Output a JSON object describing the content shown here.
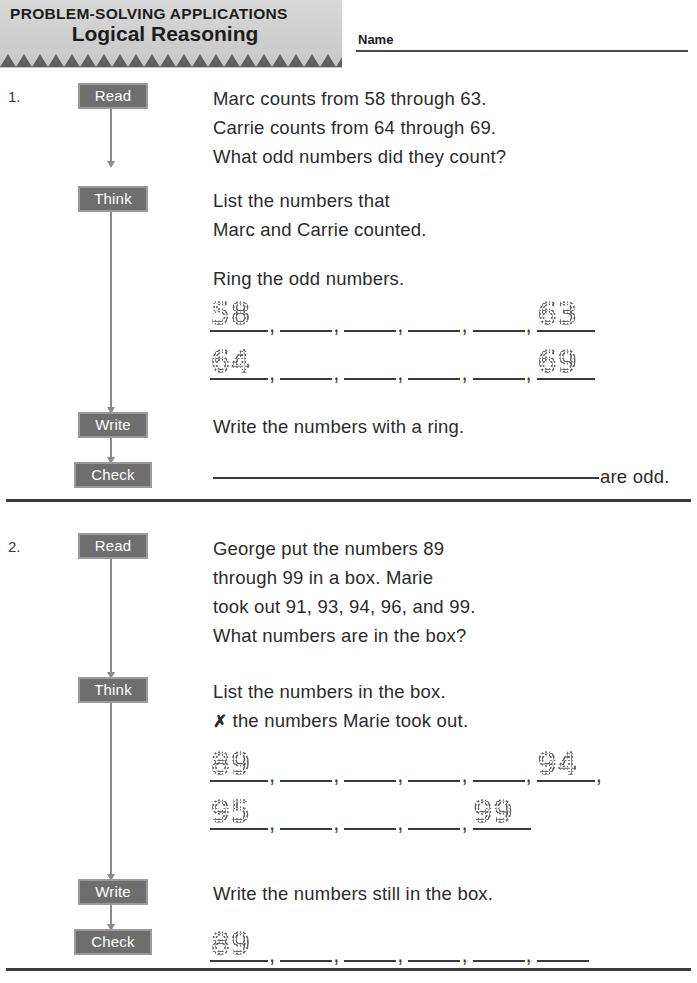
{
  "header": {
    "eyebrow": "PROBLEM-SOLVING APPLICATIONS",
    "title": "Logical Reasoning",
    "name_label": "Name",
    "triangle_count": 23
  },
  "steps": {
    "read": "Read",
    "think": "Think",
    "write": "Write",
    "check": "Check"
  },
  "colors": {
    "badge_fill": "#6e6e6e",
    "badge_border": "#9a9a9a",
    "banner_fill": "#cfcfcf",
    "triangle_fill": "#5f5f5f",
    "rule": "#3a3a3a",
    "text": "#2b2b2b"
  },
  "problems": [
    {
      "number": "1.",
      "read_lines": [
        "Marc counts from 58 through 63.",
        "Carrie counts from 64 through 69.",
        "What odd numbers did they count?"
      ],
      "think_lines": [
        "List the numbers that",
        "Marc and Carrie counted."
      ],
      "think_prompt": "Ring the odd numbers.",
      "answer_rows": [
        {
          "slots": [
            "58",
            "",
            "",
            "",
            "",
            "63"
          ],
          "trailing_comma": false
        },
        {
          "slots": [
            "64",
            "",
            "",
            "",
            "",
            "69"
          ],
          "trailing_comma": false
        }
      ],
      "write_text": "Write the numbers with a ring.",
      "check_suffix": "are odd."
    },
    {
      "number": "2.",
      "read_lines": [
        "George put the numbers 89",
        "through 99 in a box. Marie",
        "took out 91, 93, 94, 96, and 99.",
        "What numbers are in the box?"
      ],
      "think_lines": [
        "List the numbers in the box."
      ],
      "think_x_line": {
        "mark": "✗",
        "text": "the numbers Marie took out."
      },
      "answer_rows": [
        {
          "slots": [
            "89",
            "",
            "",
            "",
            "",
            "94"
          ],
          "trailing_comma": true
        },
        {
          "slots": [
            "95",
            "",
            "",
            "",
            "99"
          ],
          "trailing_comma": false
        }
      ],
      "write_text": "Write the numbers still in the box.",
      "check_row": {
        "slots": [
          "89",
          "",
          "",
          "",
          "",
          ""
        ],
        "trailing_comma": false
      }
    }
  ]
}
